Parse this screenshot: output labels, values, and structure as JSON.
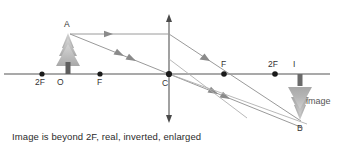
{
  "figure": {
    "kind": "ray-diagram",
    "topic": "converging-lens-object-beyond-2F",
    "background_color": "#ffffff",
    "caption": "Image is beyond 2F, real, inverted, enlarged"
  },
  "colors": {
    "axis": "#8c8c8c",
    "ray": "#8f8f8f",
    "lens": "#8a8a8a",
    "point": "#1a1a1a",
    "label": "#333333",
    "caption": "#2b2b2b",
    "object_tree": "#b9b9b9",
    "object_trunk": "#5e5e5e",
    "image_tree": "#9e9e9e",
    "image_trunk": "#6a6a6a"
  },
  "principal_axis": {
    "name": "principal-axis",
    "y": 74,
    "x_start": 4,
    "x_end": 330
  },
  "lens": {
    "name": "lens-plane",
    "x": 169,
    "y_top": 16,
    "y_bottom": 120,
    "double_headed": true
  },
  "axis_points": [
    {
      "id": "left-2F",
      "label": "2F",
      "x": 42,
      "y": 74,
      "label_x": 36,
      "label_y": 82,
      "dot": true
    },
    {
      "id": "optical-center-O",
      "label": "O",
      "x": 62,
      "y": 74,
      "label_x": 58,
      "label_y": 82,
      "dot": false
    },
    {
      "id": "left-F",
      "label": "F",
      "x": 100,
      "y": 74,
      "label_x": 97,
      "label_y": 82,
      "dot": true
    },
    {
      "id": "center-C",
      "label": "C",
      "x": 169,
      "y": 74,
      "label_x": 163,
      "label_y": 84,
      "dot": true
    },
    {
      "id": "right-F",
      "label": "F",
      "x": 224,
      "y": 74,
      "label_x": 221,
      "label_y": 66,
      "dot": true
    },
    {
      "id": "right-2F",
      "label": "2F",
      "x": 275,
      "y": 74,
      "label_x": 269,
      "label_y": 66,
      "dot": true
    },
    {
      "id": "image-base-I",
      "label": "I",
      "x": 295,
      "y": 74,
      "label_x": 293,
      "label_y": 66,
      "dot": false
    }
  ],
  "object": {
    "name": "object-tree",
    "label": "A",
    "tip_x": 68,
    "tip_y": 32,
    "base_x": 68,
    "base_y": 74,
    "label_x": 65,
    "label_y": 26
  },
  "image": {
    "name": "image-tree-inverted",
    "label": "B",
    "tip_x": 300,
    "tip_y": 120,
    "base_x": 300,
    "base_y": 74,
    "label_x": 298,
    "label_y": 130,
    "word": "image",
    "word_x": 306,
    "word_y": 101
  },
  "rays": [
    {
      "id": "ray-parallel-incident",
      "desc": "parallel ray from A to lens",
      "from": [
        70,
        34
      ],
      "to": [
        169,
        34
      ],
      "arrows": [
        [
          108,
          34
        ]
      ]
    },
    {
      "id": "ray-parallel-refracted",
      "desc": "refracted through far F then to B",
      "from": [
        169,
        34
      ],
      "to": [
        300,
        121
      ],
      "arrows": [
        [
          205,
          58
        ]
      ]
    },
    {
      "id": "ray-through-center-incident",
      "desc": "ray from A through optical centre C",
      "from": [
        70,
        34
      ],
      "to": [
        169,
        74
      ],
      "arrows": [
        [
          118,
          53
        ],
        [
          131,
          58
        ]
      ]
    },
    {
      "id": "ray-through-center-refracted",
      "desc": "continues straight from C to B",
      "from": [
        169,
        74
      ],
      "to": [
        302,
        128
      ],
      "arrows": [
        [
          212,
          91
        ],
        [
          225,
          97
        ]
      ]
    },
    {
      "id": "ray-lower-to-B",
      "desc": "lower construction ray toward B",
      "from": [
        169,
        74
      ],
      "to": [
        305,
        124
      ],
      "arrows": []
    },
    {
      "id": "ray-from-F-through-lens",
      "desc": "ray through near F rising to lens then parallel",
      "from": [
        169,
        60
      ],
      "to": [
        244,
        115
      ],
      "arrows": []
    }
  ],
  "arrow_style": {
    "head_length": 7,
    "head_width": 5
  }
}
